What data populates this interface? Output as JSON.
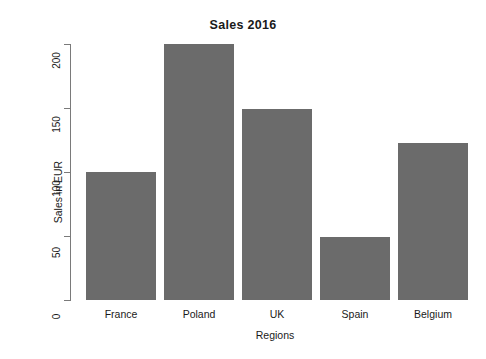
{
  "chart_data": {
    "type": "bar",
    "title": "Sales 2016",
    "xlabel": "Regions",
    "ylabel": "Sales in EUR",
    "categories": [
      "France",
      "Poland",
      "UK",
      "Spain",
      "Belgium"
    ],
    "values": [
      100,
      200,
      149,
      49,
      123
    ],
    "ylim": [
      0,
      200
    ],
    "yticks": [
      0,
      50,
      100,
      150,
      200
    ],
    "ytick_labels": [
      "0",
      "50",
      "100",
      "150",
      "200"
    ],
    "ytick_label_rotation": 90,
    "grid": false,
    "legend": false,
    "bar_color": "#6b6b6b",
    "axis_color": "#7a7a7a",
    "background": "#ffffff"
  }
}
